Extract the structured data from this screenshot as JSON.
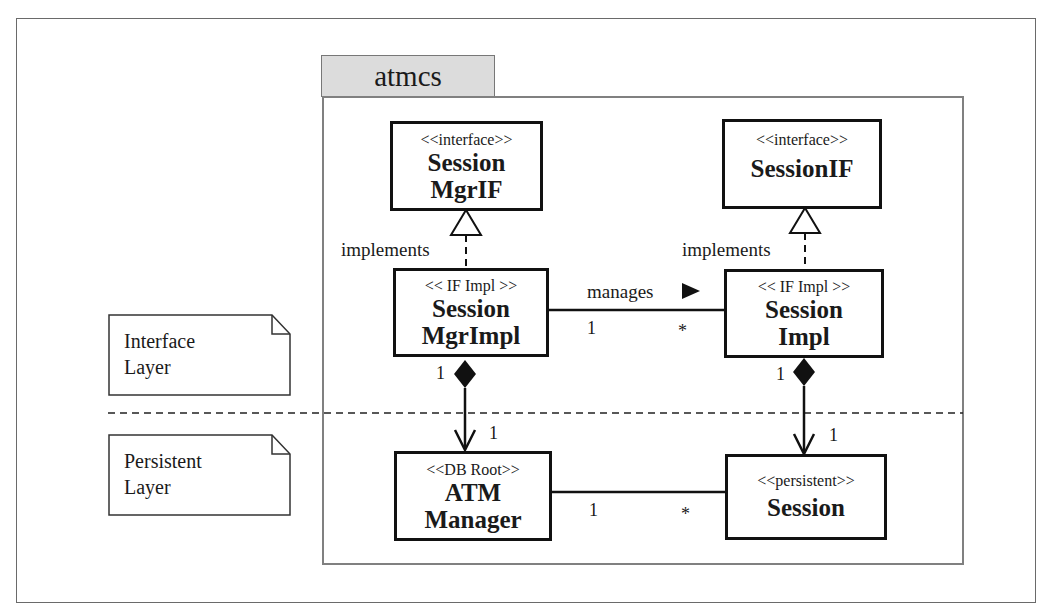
{
  "diagram": {
    "package": {
      "name": "atmcs"
    },
    "notes": [
      {
        "id": "interface-layer",
        "lines": [
          "Interface",
          "Layer"
        ]
      },
      {
        "id": "persistent-layer",
        "lines": [
          "Persistent",
          "Layer"
        ]
      }
    ],
    "classes": {
      "session_mgr_if": {
        "stereotype": "<<interface>>",
        "name_lines": [
          "Session",
          "MgrIF"
        ]
      },
      "session_if": {
        "stereotype": "<<interface>>",
        "name_lines": [
          "SessionIF"
        ]
      },
      "session_mgr_impl": {
        "stereotype": "<< IF Impl >>",
        "name_lines": [
          "Session",
          "MgrImpl"
        ]
      },
      "session_impl": {
        "stereotype": "<< IF Impl >>",
        "name_lines": [
          "Session",
          "Impl"
        ]
      },
      "atm_manager": {
        "stereotype": "<<DB Root>>",
        "name_lines": [
          "ATM",
          "Manager"
        ]
      },
      "session": {
        "stereotype": "<<persistent>>",
        "name_lines": [
          "Session"
        ]
      }
    },
    "relationships": {
      "mgr_implements": {
        "type": "realization",
        "label": "implements",
        "from": "SessionMgrImpl",
        "to": "SessionMgrIF"
      },
      "impl_implements": {
        "type": "realization",
        "label": "implements",
        "from": "SessionImpl",
        "to": "SessionIF"
      },
      "manages": {
        "type": "association",
        "label": "manages",
        "direction_arrow": "▶",
        "from_mult": "1",
        "to_mult": "*"
      },
      "mgr_composition": {
        "type": "composition",
        "whole_mult": "1",
        "part_mult": "1"
      },
      "impl_composition": {
        "type": "composition",
        "whole_mult": "1",
        "part_mult": "1"
      },
      "atm_session": {
        "type": "association",
        "from_mult": "1",
        "to_mult": "*"
      }
    },
    "colors": {
      "line": "#111111",
      "package_tab": "#dcdcdc",
      "frame": "#6a6a6a"
    }
  }
}
